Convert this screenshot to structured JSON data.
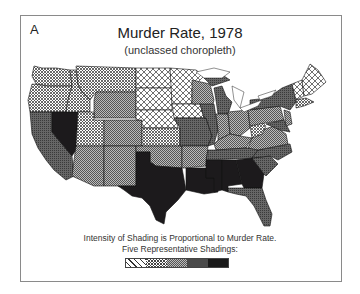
{
  "figure": {
    "panel_label": "A",
    "title": "Murder Rate, 1978",
    "subtitle": "(unclassed choropleth)",
    "caption_line1": "Intensity of Shading is Proportional to Murder Rate.",
    "caption_line2": "Five Representative Shadings:"
  },
  "legend": {
    "shadings": [
      {
        "name": "lightest",
        "pattern": "open-crosshatch",
        "fill": "#e8e8e8"
      },
      {
        "name": "light",
        "pattern": "dense-crosshatch",
        "fill": "#bdbdbd"
      },
      {
        "name": "medium",
        "pattern": "fine-dots",
        "fill": "#9a9a9a"
      },
      {
        "name": "dark",
        "pattern": "dark-gray",
        "fill": "#555555"
      },
      {
        "name": "darkest",
        "pattern": "near-black",
        "fill": "#1a1a1a"
      }
    ]
  },
  "colors": {
    "frame": "#8a8a8a",
    "text": "#222222",
    "state_border": "#111111"
  }
}
